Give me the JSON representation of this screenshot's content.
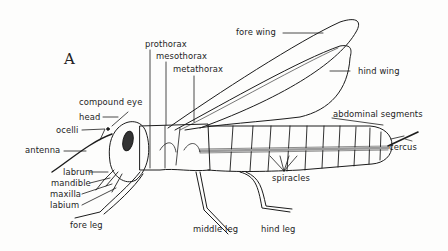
{
  "figure": {
    "panel_label": "A",
    "colors": {
      "ink": "#1c1c1c",
      "paper": "#fdfdfc",
      "eye_fill": "#333333"
    }
  },
  "labels": {
    "prothorax": "prothorax",
    "mesothorax": "mesothorax",
    "metathorax": "metathorax",
    "fore_wing": "fore wing",
    "hind_wing": "hind wing",
    "compound_eye": "compound eye",
    "head": "head",
    "ocelli": "ocelli",
    "antenna": "antenna",
    "labrum": "labrum",
    "mandible": "mandible",
    "maxilla": "maxilla",
    "labium": "labium",
    "abdominal_segments": "abdominal segments",
    "cercus": "cercus",
    "spiracles": "spiracles",
    "fore_leg": "fore leg",
    "middle_leg": "middle leg",
    "hind_leg": "hind leg"
  }
}
